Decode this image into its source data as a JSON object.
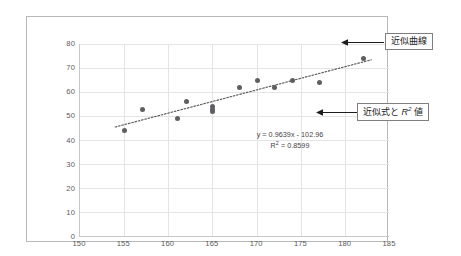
{
  "chart_data": {
    "type": "scatter",
    "title": "",
    "xlabel": "",
    "ylabel": "",
    "xlim": [
      150,
      185
    ],
    "ylim": [
      0,
      80
    ],
    "xticks": [
      150,
      155,
      160,
      165,
      170,
      175,
      180,
      185
    ],
    "yticks": [
      0,
      10,
      20,
      30,
      40,
      50,
      60,
      70,
      80
    ],
    "grid": true,
    "legend": "none",
    "marker_color": "#5f5f63",
    "trendline": {
      "type": "linear-dotted",
      "slope": 0.9639,
      "intercept": -102.96,
      "r_squared": 0.8599,
      "equation_text": "y = 0.9639x - 102.96",
      "r2_text_prefix": "R",
      "r2_text_sup": "2",
      "r2_text_value": " = 0.8599",
      "x_start": 154,
      "x_end": 183
    },
    "points": [
      {
        "x": 155,
        "y": 44
      },
      {
        "x": 157,
        "y": 53
      },
      {
        "x": 161,
        "y": 49
      },
      {
        "x": 162,
        "y": 56
      },
      {
        "x": 165,
        "y": 52
      },
      {
        "x": 165,
        "y": 53
      },
      {
        "x": 165,
        "y": 54
      },
      {
        "x": 168,
        "y": 62
      },
      {
        "x": 170,
        "y": 65
      },
      {
        "x": 172,
        "y": 62
      },
      {
        "x": 174,
        "y": 65
      },
      {
        "x": 177,
        "y": 64
      },
      {
        "x": 182,
        "y": 74
      }
    ]
  },
  "annotations": {
    "curve_label": "近似曲線",
    "formula_label_prefix": "近似式と ",
    "formula_label_r": "R",
    "formula_label_sup": "2",
    "formula_label_suffix": " 値"
  }
}
